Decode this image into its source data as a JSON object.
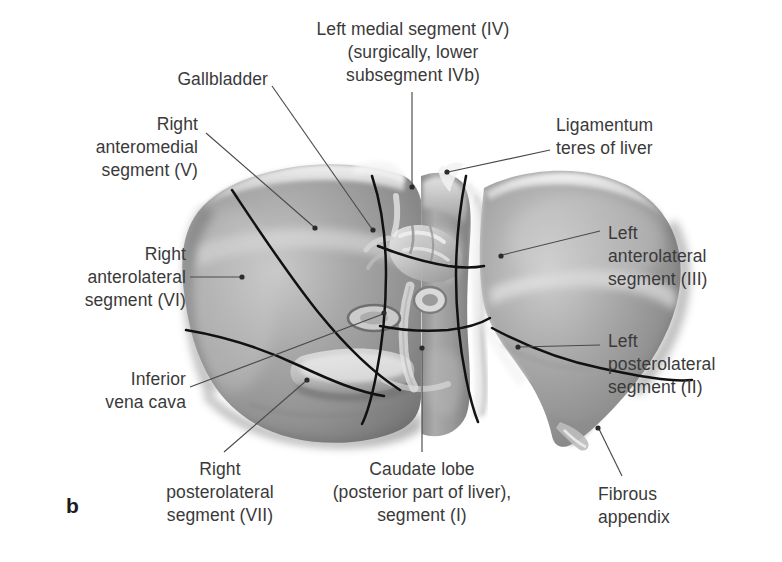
{
  "figure": {
    "kind": "anatomical-illustration",
    "panel_letter": "b",
    "style": "grayscale halftone medical illustration",
    "colors": {
      "background": "#ffffff",
      "label_text": "#3a3a3a",
      "leader_line": "#4a4a4a",
      "segment_boundary": "#111111",
      "parenchyma_mid": "#9a9a9a",
      "parenchyma_light": "#d8d8d8",
      "parenchyma_dark": "#6e6e6e"
    }
  },
  "labels": [
    {
      "id": "left-medial-segment",
      "text": "Left medial segment (IV)\n(surgically, lower\nsubsegment IVb)",
      "align": "center",
      "x": 298,
      "y": 18,
      "w": 230
    },
    {
      "id": "gallbladder",
      "text": "Gallbladder",
      "align": "right",
      "x": 118,
      "y": 68,
      "w": 150
    },
    {
      "id": "right-anteromedial-segment",
      "text": "Right\nanteromedial\nsegment (V)",
      "align": "right",
      "x": 30,
      "y": 113,
      "w": 168
    },
    {
      "id": "right-anterolateral-segment",
      "text": "Right\nanterolateral\nsegment (VI)",
      "align": "right",
      "x": 18,
      "y": 243,
      "w": 168
    },
    {
      "id": "inferior-vena-cava",
      "text": "Inferior\nvena cava",
      "align": "right",
      "x": 30,
      "y": 368,
      "w": 156
    },
    {
      "id": "right-posterolateral-segment",
      "text": "Right\nposterolateral\nsegment (VII)",
      "align": "center",
      "x": 128,
      "y": 458,
      "w": 184
    },
    {
      "id": "caudate-lobe",
      "text": "Caudate lobe\n(posterior part of liver),\nsegment (I)",
      "align": "center",
      "x": 312,
      "y": 458,
      "w": 220
    },
    {
      "id": "fibrous-appendix",
      "text": "Fibrous\nappendix",
      "align": "left",
      "x": 598,
      "y": 483,
      "w": 140
    },
    {
      "id": "ligamentum-teres",
      "text": "Ligamentum\nteres of liver",
      "align": "left",
      "x": 556,
      "y": 114,
      "w": 170
    },
    {
      "id": "left-anterolateral-segment",
      "text": "Left\nanterolateral\nsegment (III)",
      "align": "left",
      "x": 608,
      "y": 222,
      "w": 160
    },
    {
      "id": "left-posterolateral-segment",
      "text": "Left\nposterolateral\nsegment (II)",
      "align": "left",
      "x": 608,
      "y": 330,
      "w": 160
    }
  ],
  "leader_lines": [
    {
      "id": "leader-left-medial-segment",
      "from": [
        412,
        92
      ],
      "to": [
        412,
        188
      ],
      "dot": "to"
    },
    {
      "id": "leader-gallbladder",
      "from": [
        272,
        92
      ],
      "to": [
        373,
        230
      ],
      "dot": "to"
    },
    {
      "id": "leader-right-anteromedial",
      "from": [
        204,
        133
      ],
      "to": [
        315,
        228
      ],
      "dot": "to"
    },
    {
      "id": "leader-right-anterolateral",
      "from": [
        192,
        277
      ],
      "to": [
        242,
        277
      ],
      "dot": "to"
    },
    {
      "id": "leader-inferior-vena-cava",
      "from": [
        192,
        386
      ],
      "to": [
        384,
        313
      ],
      "dot": "to"
    },
    {
      "id": "leader-right-posterolateral",
      "from": [
        220,
        450
      ],
      "to": [
        307,
        380
      ],
      "dot": "to"
    },
    {
      "id": "leader-caudate-lobe",
      "from": [
        422,
        450
      ],
      "to": [
        422,
        348
      ],
      "dot": "to"
    },
    {
      "id": "leader-fibrous-appendix",
      "from": [
        620,
        474
      ],
      "to": [
        598,
        428
      ],
      "dot": "to"
    },
    {
      "id": "leader-ligamentum-teres",
      "from": [
        550,
        147
      ],
      "to": [
        447,
        172
      ],
      "dot": "to"
    },
    {
      "id": "leader-left-anterolateral",
      "from": [
        600,
        230
      ],
      "to": [
        501,
        256
      ],
      "dot": "to"
    },
    {
      "id": "leader-left-posterolateral",
      "from": [
        600,
        344
      ],
      "to": [
        518,
        347
      ],
      "dot": "to"
    }
  ],
  "anatomy_features": [
    {
      "id": "right-lobe",
      "note": "large left-of-image mass, segments V/VI/VII"
    },
    {
      "id": "left-lobe",
      "note": "right-of-image mass, segments II/III"
    },
    {
      "id": "caudate-lobe-body",
      "note": "central vertical column, segment I"
    },
    {
      "id": "porta-hepatis",
      "note": "central hilum with portal vein, hepatic artery, bile duct"
    },
    {
      "id": "gallbladder-fossa",
      "note": "pale oval depression left of hilum"
    },
    {
      "id": "inferior-vena-cava-groove",
      "note": "vertical groove right of caudate lobe"
    },
    {
      "id": "ligamentum-teres-notch",
      "note": "notch at superior margin between lobes"
    },
    {
      "id": "fibrous-appendix-tip",
      "note": "pointed inferolateral tip of left lobe"
    },
    {
      "id": "segment-boundary-lines",
      "note": "dark curved lines dividing hepatic segments"
    }
  ]
}
